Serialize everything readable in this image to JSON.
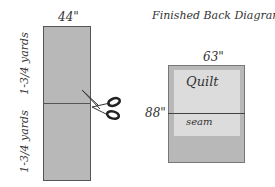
{
  "left_diagram": {
    "width_label": "44\"",
    "top_length_label": "1-3/4 yards",
    "bottom_length_label": "1-3/4 yards",
    "fabric_color": "#b8b8b8",
    "icon": "scissors-icon"
  },
  "right_diagram": {
    "title": "Finished Back Diagram",
    "width_label": "63\"",
    "height_label": "88\"",
    "quilt_label": "Quilt",
    "seam_label": "seam",
    "backing_color": "#b8b8b8",
    "quilt_color": "#dcdcdc"
  }
}
